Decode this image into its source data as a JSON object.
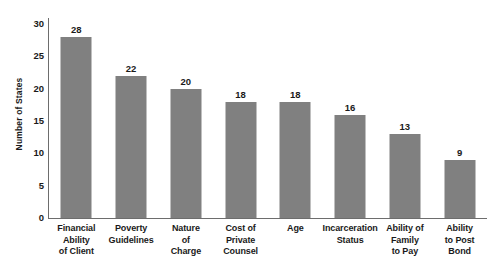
{
  "chart_data": {
    "type": "bar",
    "title": "",
    "xlabel": "",
    "ylabel": "Number of States",
    "ylim": [
      0,
      30
    ],
    "yticks": [
      0,
      5,
      10,
      15,
      20,
      25,
      30
    ],
    "ytick_labels": [
      "0",
      "5",
      "10",
      "15",
      "20",
      "25",
      "30"
    ],
    "grid": false,
    "legend": false,
    "bar_color": "#808080",
    "axis_color": "#6d6d6d",
    "background_color": "#ffffff",
    "categories": [
      "Financial Ability of Client",
      "Poverty Guidelines",
      "Nature of Charge",
      "Cost of Private Counsel",
      "Age",
      "Incarceration Status",
      "Ability of Family to Pay",
      "Ability to Post Bond"
    ],
    "category_lines": [
      [
        "Financial",
        "Ability",
        "of Client"
      ],
      [
        "Poverty",
        "Guidelines"
      ],
      [
        "Nature",
        "of",
        "Charge"
      ],
      [
        "Cost of",
        "Private",
        "Counsel"
      ],
      [
        "Age"
      ],
      [
        "Incarceration",
        "Status"
      ],
      [
        "Ability of",
        "Family",
        "to Pay"
      ],
      [
        "Ability",
        "to Post",
        "Bond"
      ]
    ],
    "values": [
      28,
      22,
      20,
      18,
      18,
      16,
      13,
      9
    ],
    "value_labels": [
      "28",
      "22",
      "20",
      "18",
      "18",
      "16",
      "13",
      "9"
    ]
  }
}
